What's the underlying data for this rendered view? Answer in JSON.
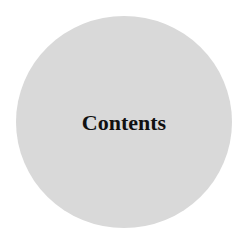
{
  "button": {
    "label": "Contents",
    "shape": "circle",
    "fill_color": "#d9d9d9",
    "text_color": "#111111"
  }
}
